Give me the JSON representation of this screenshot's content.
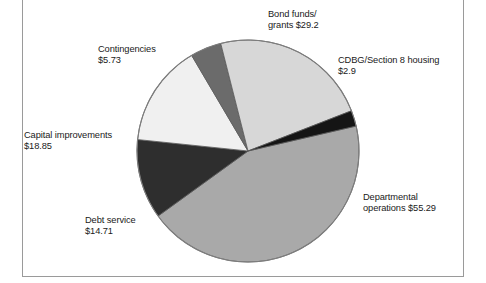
{
  "figure": {
    "background_color": "#ffffff",
    "frame_color": "#9a9a9a",
    "text_color": "#1a1a1a"
  },
  "chart_data": {
    "type": "pie",
    "title": "",
    "subtitle": "",
    "xlabel": "",
    "ylabel": "",
    "legend_position": "none",
    "grid": false,
    "unit": "$ (millions)",
    "total": 126.68,
    "start_angle_deg": -13,
    "direction": "clockwise",
    "center": {
      "x": 248,
      "y": 151
    },
    "radius": 111,
    "categories": [
      "Departmental operations",
      "Debt service",
      "Capital improvements",
      "Contingencies",
      "Bond funds/grants",
      "CDBG/Section 8 housing"
    ],
    "values": [
      55.29,
      14.71,
      18.85,
      5.73,
      29.2,
      2.9
    ],
    "slices": [
      {
        "name": "Departmental operations",
        "value": 55.29,
        "value_label": "$55.29",
        "label_line1": "Departmental",
        "label_line2": "operations $55.29",
        "color": "#a9a9a9",
        "angle_deg": 157.13
      },
      {
        "name": "Debt service",
        "value": 14.71,
        "value_label": "$14.71",
        "label_line1": "Debt service",
        "label_line2": "$14.71",
        "color": "#2e2e2e",
        "angle_deg": 41.81
      },
      {
        "name": "Capital improvements",
        "value": 18.85,
        "value_label": "$18.85",
        "label_line1": "Capital improvements",
        "label_line2": "$18.85",
        "color": "#f0f0f0",
        "angle_deg": 53.57
      },
      {
        "name": "Contingencies",
        "value": 5.73,
        "value_label": "$5.73",
        "label_line1": "Contingencies",
        "label_line2": "$5.73",
        "color": "#6b6b6b",
        "angle_deg": 16.28
      },
      {
        "name": "Bond funds/grants",
        "value": 29.2,
        "value_label": "$29.2",
        "label_line1": "Bond funds/",
        "label_line2": "grants $29.2",
        "color": "#d7d7d7",
        "angle_deg": 82.97
      },
      {
        "name": "CDBG/Section 8 housing",
        "value": 2.9,
        "value_label": "$2.9",
        "label_line1": "CDBG/Section 8 housing",
        "label_line2": "$2.9",
        "color": "#151515",
        "angle_deg": 8.24
      }
    ],
    "annotations": {
      "bond": "Bond funds/\ngrants $29.2",
      "cdbg": "CDBG/Section 8 housing\n$2.9",
      "departmental": "Departmental\noperations $55.29",
      "contingencies": "Contingencies\n$5.73",
      "capital": "Capital improvements\n$18.85",
      "debt": "Debt service\n$14.71"
    }
  }
}
